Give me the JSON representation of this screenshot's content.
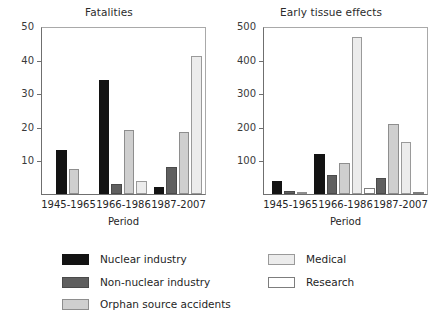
{
  "chart_data": [
    {
      "type": "bar",
      "title": "Fatalities",
      "xlabel": "Period",
      "ylabel": "",
      "ylim": [
        0,
        50
      ],
      "yticks": [
        0,
        10,
        20,
        30,
        40,
        50
      ],
      "ytick_labels": [
        "",
        "10",
        "20",
        "30",
        "40",
        "50"
      ],
      "categories": [
        "1945-1965",
        "1966-1986",
        "1987-2007"
      ],
      "grid": false,
      "legend_position": "bottom",
      "series": [
        {
          "name": "Nuclear industry",
          "values": [
            13,
            34,
            2
          ]
        },
        {
          "name": "Non-nuclear industry",
          "values": [
            0,
            3,
            8
          ]
        },
        {
          "name": "Orphan source accidents",
          "values": [
            7.5,
            19,
            18.5
          ]
        },
        {
          "name": "Medical",
          "values": [
            0,
            4,
            41
          ]
        },
        {
          "name": "Research",
          "values": [
            0,
            0,
            0
          ]
        }
      ]
    },
    {
      "type": "bar",
      "title": "Early tissue effects",
      "xlabel": "Period",
      "ylabel": "",
      "ylim": [
        0,
        500
      ],
      "yticks": [
        0,
        100,
        200,
        300,
        400,
        500
      ],
      "ytick_labels": [
        "",
        "100",
        "200",
        "300",
        "400",
        "500"
      ],
      "categories": [
        "1945-1965",
        "1966-1986",
        "1987-2007"
      ],
      "grid": false,
      "legend_position": "bottom",
      "series": [
        {
          "name": "Nuclear industry",
          "values": [
            40,
            120,
            0
          ]
        },
        {
          "name": "Non-nuclear industry",
          "values": [
            10,
            57,
            48
          ]
        },
        {
          "name": "Orphan source accidents",
          "values": [
            5,
            93,
            207
          ]
        },
        {
          "name": "Medical",
          "values": [
            0,
            468,
            155
          ]
        },
        {
          "name": "Research",
          "values": [
            0,
            18,
            6
          ]
        }
      ]
    }
  ],
  "panels": [
    {
      "title": "Fatalities",
      "xlabel": "Period",
      "yticks": [
        "50",
        "40",
        "30",
        "20",
        "10"
      ],
      "xticks": [
        "1945-1965",
        "1966-1986",
        "1987-2007"
      ]
    },
    {
      "title": "Early tissue effects",
      "xlabel": "Period",
      "yticks": [
        "500",
        "400",
        "300",
        "200",
        "100"
      ],
      "xticks": [
        "1945-1965",
        "1966-1986",
        "1987-2007"
      ]
    }
  ],
  "legend": {
    "column_a": [
      {
        "label": "Nuclear industry",
        "color": "#131313",
        "swatch": "sw-nuclear"
      },
      {
        "label": "Non-nuclear industry",
        "color": "#5f5f5f",
        "swatch": "sw-nonnuclear"
      },
      {
        "label": "Orphan source accidents",
        "color": "#cfcfcf",
        "swatch": "sw-orphan"
      }
    ],
    "column_b": [
      {
        "label": "Medical",
        "color": "#ececec",
        "swatch": "sw-medical"
      },
      {
        "label": "Research",
        "color": "#ffffff",
        "swatch": "sw-research"
      }
    ]
  }
}
